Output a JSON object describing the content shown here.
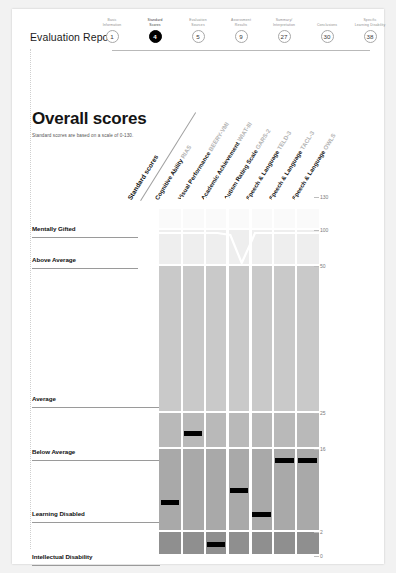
{
  "header": {
    "report_title": "Evaluation Report",
    "steps": [
      {
        "label": "Basic\nInformation",
        "number": "1",
        "active": false
      },
      {
        "label": "Standard\nScores",
        "number": "4",
        "active": true
      },
      {
        "label": "Evaluation\nSources",
        "number": "5",
        "active": false
      },
      {
        "label": "Assessment\nResults",
        "number": "9",
        "active": false
      },
      {
        "label": "Summary/\nInterpretation",
        "number": "27",
        "active": false
      },
      {
        "label": "Conclusions",
        "number": "30",
        "active": false
      },
      {
        "label": "Specific\nLearning Disability",
        "number": "38",
        "active": false
      }
    ]
  },
  "page": {
    "title": "Overall scores",
    "subtitle": "Standard scores are based on a scale of 0-130."
  },
  "chart_data": {
    "type": "heatmap",
    "title": "Overall scores",
    "ylabel": "Standard score",
    "ylim": [
      0,
      130
    ],
    "grid": true,
    "legend": "none",
    "column_header_prefix": "Standard scores",
    "categories": [
      {
        "name": "Cognitive Ability",
        "instrument": "RIAS"
      },
      {
        "name": "Visual Performance",
        "instrument": "BEERY-VMI"
      },
      {
        "name": "Academic Achievement",
        "instrument": "WIAT-III"
      },
      {
        "name": "Autism Rating Scale",
        "instrument": "GARS-2"
      },
      {
        "name": "Speech & Language",
        "instrument": "TELD-3"
      },
      {
        "name": "Speech & Language",
        "instrument": "TACL-3"
      },
      {
        "name": "Speech & Language",
        "instrument": "OWLS"
      }
    ],
    "bands": [
      {
        "label": "Mentally Gifted",
        "top": 130,
        "bottom": 100,
        "shade": "#fafafa"
      },
      {
        "label": "Above Average",
        "top": 100,
        "bottom": 50,
        "shade": "#eeeeee"
      },
      {
        "label": "Average",
        "top": 50,
        "bottom": 25,
        "shade": "#c9c9c9"
      },
      {
        "label": "Below Average",
        "top": 25,
        "bottom": 16,
        "shade": "#b9b9b9"
      },
      {
        "label": "Learning Disabled",
        "top": 16,
        "bottom": 2,
        "shade": "#a9a9a9"
      },
      {
        "label": "Intellectual Disability",
        "top": 2,
        "bottom": 0,
        "shade": "#8f8f8f"
      }
    ],
    "yticks": [
      130,
      100,
      50,
      25,
      16,
      2,
      0
    ],
    "values": [
      7,
      20,
      1,
      9,
      5,
      14,
      14
    ],
    "series": [
      {
        "name": "Standard score",
        "values": [
          7,
          20,
          1,
          9,
          5,
          14,
          14
        ]
      }
    ]
  }
}
